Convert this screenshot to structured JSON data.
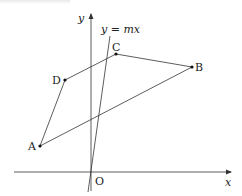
{
  "diagram": {
    "type": "coordinate-geometry",
    "axes": {
      "x_label": "x",
      "y_label": "y",
      "origin_label": "O"
    },
    "line": {
      "label": "y = mx",
      "from": [
        88,
        192
      ],
      "to": [
        110,
        36
      ]
    },
    "points": [
      {
        "id": "A",
        "label": "A",
        "px": [
          40,
          146
        ]
      },
      {
        "id": "B",
        "label": "B",
        "px": [
          192,
          67
        ]
      },
      {
        "id": "C",
        "label": "C",
        "px": [
          116,
          54
        ]
      },
      {
        "id": "D",
        "label": "D",
        "px": [
          65,
          80
        ]
      }
    ],
    "polygon": [
      "A",
      "B",
      "C",
      "D"
    ],
    "colors": {
      "stroke": "#333333",
      "text": "#222222",
      "background": "#ffffff"
    }
  }
}
